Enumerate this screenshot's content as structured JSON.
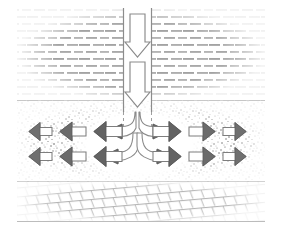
{
  "figure": {
    "title": "",
    "type": "cross-section-flow-diagram",
    "colors": {
      "background": "#ffffff",
      "outline": "#8a8a8a",
      "arrow_head_dark": "#5f5f5f",
      "arrow_head_mid": "#6e6e6e",
      "arrow_shaft_fill": "#ffffff",
      "water_hatch": "#8f8f8f",
      "sand_stipple": "#6a6a6a",
      "bedrock_line": "#9a9a9a",
      "boundary_line": "#5a5a5a",
      "cavity_fill": "#ffffff"
    }
  },
  "layers": [
    {
      "id": "water-layer",
      "name": "water-layer",
      "pattern": "horizontal-dash-hatch",
      "y_top": 8,
      "y_bottom": 101,
      "x_left": 17,
      "x_right": 265
    },
    {
      "id": "sand-layer",
      "name": "sand-aquifer-layer",
      "pattern": "stipple",
      "y_top": 101,
      "y_bottom": 182,
      "x_left": 17,
      "x_right": 265
    },
    {
      "id": "bedrock-layer",
      "name": "bedrock-layer",
      "pattern": "slanted-brick",
      "y_top": 182,
      "y_bottom": 222,
      "x_left": 17,
      "x_right": 265
    }
  ],
  "channel": {
    "name": "vertical-infiltration-channel",
    "x_left": 124,
    "x_right": 151,
    "y_top": 8,
    "y_bottom": 112
  },
  "cavity": {
    "name": "flow-cavity",
    "cx": 140,
    "cy": 144,
    "rx": 72,
    "ry": 40
  },
  "vertical_arrows": [
    {
      "name": "downflow-arrow-upper",
      "direction": "down",
      "x": 137,
      "y_start": 16,
      "y_end": 50
    },
    {
      "name": "downflow-arrow-lower",
      "direction": "down",
      "x": 137,
      "y_start": 62,
      "y_end": 106
    }
  ],
  "branch_arrows": [
    {
      "name": "branch-upper-left",
      "direction": "left",
      "level": "upper"
    },
    {
      "name": "branch-upper-right",
      "direction": "right",
      "level": "upper"
    },
    {
      "name": "branch-lower-left",
      "direction": "left",
      "level": "lower"
    },
    {
      "name": "branch-lower-right",
      "direction": "right",
      "level": "lower"
    }
  ],
  "lateral_arrows": {
    "upper_row_y": 131,
    "lower_row_y": 155,
    "left": [
      {
        "name": "lateral-arrow-left-inner-upper",
        "row": "upper",
        "rank": 1,
        "tip_x": 100,
        "tail_x": 122,
        "size": "large"
      },
      {
        "name": "lateral-arrow-left-mid-upper",
        "row": "upper",
        "rank": 2,
        "tip_x": 66,
        "tail_x": 86,
        "size": "medium"
      },
      {
        "name": "lateral-arrow-left-outer-upper",
        "row": "upper",
        "rank": 3,
        "tip_x": 34,
        "tail_x": 52,
        "size": "small"
      },
      {
        "name": "lateral-arrow-left-inner-lower",
        "row": "lower",
        "rank": 1,
        "tip_x": 100,
        "tail_x": 122,
        "size": "large"
      },
      {
        "name": "lateral-arrow-left-mid-lower",
        "row": "lower",
        "rank": 2,
        "tip_x": 66,
        "tail_x": 86,
        "size": "medium"
      },
      {
        "name": "lateral-arrow-left-outer-lower",
        "row": "lower",
        "rank": 3,
        "tip_x": 34,
        "tail_x": 52,
        "size": "small"
      }
    ],
    "right": [
      {
        "name": "lateral-arrow-right-inner-upper",
        "row": "upper",
        "rank": 1,
        "tip_x": 180,
        "tail_x": 158,
        "size": "large"
      },
      {
        "name": "lateral-arrow-right-mid-upper",
        "row": "upper",
        "rank": 2,
        "tip_x": 214,
        "tail_x": 194,
        "size": "medium"
      },
      {
        "name": "lateral-arrow-right-outer-upper",
        "row": "upper",
        "rank": 3,
        "tip_x": 246,
        "tail_x": 228,
        "size": "small"
      },
      {
        "name": "lateral-arrow-right-inner-lower",
        "row": "lower",
        "rank": 1,
        "tip_x": 180,
        "tail_x": 158,
        "size": "large"
      },
      {
        "name": "lateral-arrow-right-mid-lower",
        "row": "lower",
        "rank": 2,
        "tip_x": 214,
        "tail_x": 194,
        "size": "medium"
      },
      {
        "name": "lateral-arrow-right-outer-lower",
        "row": "lower",
        "rank": 3,
        "tip_x": 246,
        "tail_x": 228,
        "size": "small"
      }
    ]
  },
  "labels": {
    "water": "",
    "sand": "",
    "bedrock": "",
    "caption": ""
  }
}
